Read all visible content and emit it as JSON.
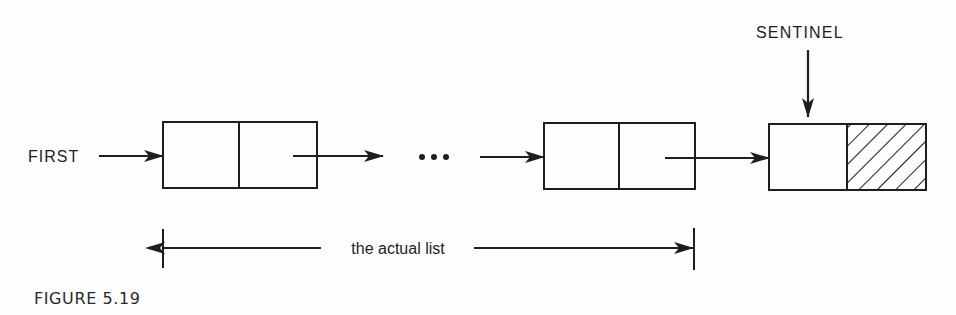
{
  "figure": {
    "caption": "FIGURE 5.19",
    "labels": {
      "first": "FIRST",
      "sentinel": "SENTINEL",
      "ellipsis": "•••",
      "span": "the actual list"
    },
    "nodes": [
      {
        "id": "node-1",
        "kind": "list-node",
        "fields": [
          "data",
          "next"
        ],
        "next_hatched": false
      },
      {
        "id": "node-n",
        "kind": "list-node",
        "fields": [
          "data",
          "next"
        ],
        "next_hatched": false
      },
      {
        "id": "sentinel-node",
        "kind": "sentinel-node",
        "fields": [
          "data",
          "next"
        ],
        "next_hatched": true
      }
    ],
    "edges": [
      {
        "from": "FIRST",
        "to": "node-1"
      },
      {
        "from": "node-1",
        "to": "ellipsis"
      },
      {
        "from": "ellipsis",
        "to": "node-n"
      },
      {
        "from": "node-n",
        "to": "sentinel-node"
      },
      {
        "from": "SENTINEL",
        "to": "sentinel-node"
      }
    ],
    "colors": {
      "ink": "#1e1e1e",
      "paper": "#fdfdfd"
    }
  }
}
